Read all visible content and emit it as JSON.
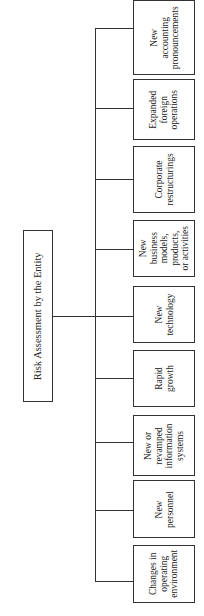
{
  "diagram": {
    "orientation": "rotated 90 degrees counter-clockwise",
    "root": {
      "label": "Risk Assessment by the Entity"
    },
    "children": [
      {
        "label": "New\naccounting\npronouncements"
      },
      {
        "label": "Expanded\nforeign\noperations"
      },
      {
        "label": "Corporate\nrestructurings"
      },
      {
        "label": "New\nbusiness\nmodels,\nproducts,\nor activities"
      },
      {
        "label": "New\ntechnology"
      },
      {
        "label": "Rapid\ngrowth"
      },
      {
        "label": "New or\nrevamped\ninformation\nsystems"
      },
      {
        "label": "New\npersonnel"
      },
      {
        "label": "Changes in\noperating\nenvironment"
      }
    ]
  }
}
